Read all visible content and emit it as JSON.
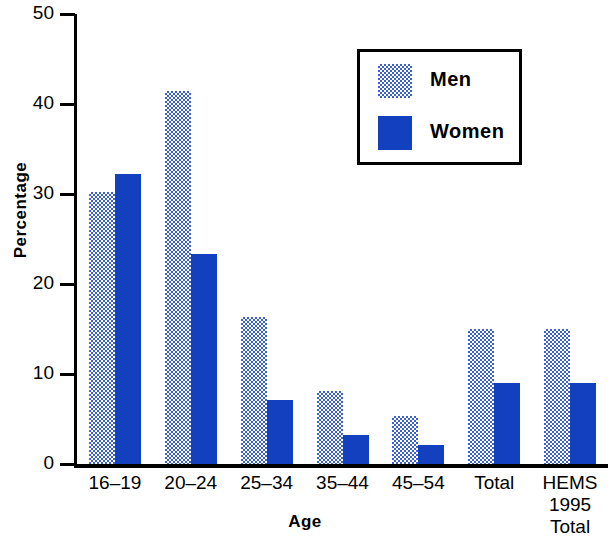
{
  "chart_data": {
    "type": "bar",
    "title": "",
    "xlabel": "Age",
    "ylabel": "Percentage",
    "ylim": [
      0,
      50
    ],
    "yticks": [
      0,
      10,
      20,
      30,
      40,
      50
    ],
    "grid": false,
    "legend_position": "top-right",
    "categories": [
      "16–19",
      "20–24",
      "25–34",
      "35–44",
      "45–54",
      "Total",
      "HEMS\n1995\nTotal"
    ],
    "series": [
      {
        "name": "Men",
        "color": "#3a5fd0",
        "fill": "stipple-checker",
        "values": [
          30.7,
          41.9,
          16.8,
          8.6,
          5.8,
          15.5,
          15.5
        ]
      },
      {
        "name": "Women",
        "color": "#1340be",
        "fill": "solid",
        "values": [
          32.7,
          23.8,
          7.6,
          3.7,
          2.6,
          9.5,
          9.5
        ]
      }
    ]
  },
  "axes": {
    "y_tick_labels": [
      "50",
      "40",
      "30",
      "20",
      "10",
      "0"
    ],
    "y_title": "Percentage",
    "x_title": "Age",
    "x_tick_labels": [
      "16–19",
      "20–24",
      "25–34",
      "35–44",
      "45–54",
      "Total",
      "HEMS\n1995\nTotal"
    ]
  },
  "legend": {
    "entries": [
      {
        "label": "Men",
        "swatch": "men-swatch"
      },
      {
        "label": "Women",
        "swatch": "women-swatch"
      }
    ]
  }
}
